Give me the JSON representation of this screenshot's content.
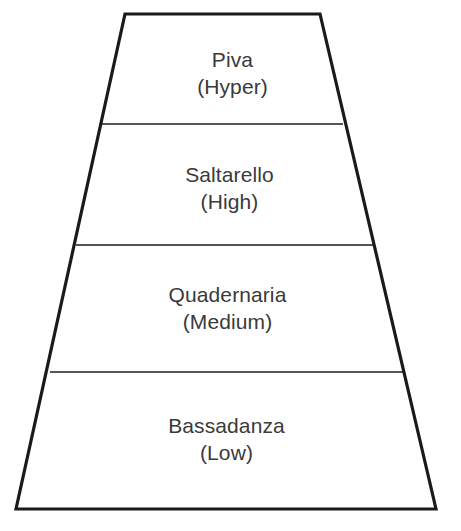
{
  "diagram": {
    "type": "trapezoid-pyramid",
    "orientation": "wide-at-bottom",
    "background_color": "#ffffff",
    "outline_color": "#1a1a1a",
    "divider_color": "#555555",
    "text_color": "#3a3a3a",
    "outline_width_px": 3,
    "divider_width_px": 2,
    "geometry": {
      "top_left": [
        125,
        14
      ],
      "top_right": [
        320,
        14
      ],
      "bottom_right": [
        436,
        509
      ],
      "bottom_left": [
        16,
        509
      ],
      "dividers_y": [
        124,
        245,
        372
      ]
    },
    "tiers": [
      {
        "name": "Piva",
        "qualifier": "(Hyper)",
        "band_top": 14,
        "band_bottom": 124,
        "left_x": 125,
        "right_x": 320
      },
      {
        "name": "Saltarello",
        "qualifier": "(High)",
        "band_top": 124,
        "band_bottom": 245,
        "left_x": 102,
        "right_x": 343
      },
      {
        "name": "Quadernaria",
        "qualifier": "(Medium)",
        "band_top": 245,
        "band_bottom": 372,
        "left_x": 76,
        "right_x": 375
      },
      {
        "name": "Bassadanza",
        "qualifier": "(Low)",
        "band_top": 372,
        "band_bottom": 509,
        "left_x": 50,
        "right_x": 405
      }
    ]
  }
}
